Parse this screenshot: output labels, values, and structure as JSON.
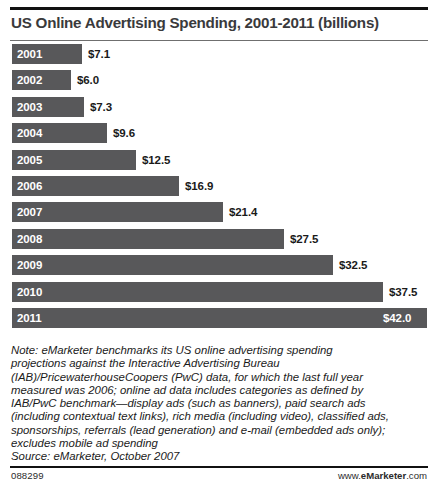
{
  "chart_data": {
    "type": "bar",
    "title": "US Online Advertising Spending, 2001-2011 (billions)",
    "orientation": "horizontal",
    "xlabel": "",
    "ylabel": "",
    "xlim": [
      0,
      42.0
    ],
    "grid": false,
    "legend": "none",
    "categories": [
      "2001",
      "2002",
      "2003",
      "2004",
      "2005",
      "2006",
      "2007",
      "2008",
      "2009",
      "2010",
      "2011"
    ],
    "values": [
      7.1,
      6.0,
      7.3,
      9.6,
      12.5,
      16.9,
      21.4,
      27.5,
      32.5,
      37.5,
      42.0
    ],
    "value_labels": [
      "$7.1",
      "$6.0",
      "$7.3",
      "$9.6",
      "$12.5",
      "$16.9",
      "$21.4",
      "$27.5",
      "$32.5",
      "$37.5",
      "$42.0"
    ],
    "label_placement": [
      "outside",
      "outside",
      "outside",
      "outside",
      "outside",
      "outside",
      "outside",
      "outside",
      "outside",
      "outside",
      "inside"
    ],
    "bar_color": "#58585a",
    "value_label_color": "#1a1a1a",
    "inside_label_color": "#ffffff",
    "category_label_color": "#ffffff"
  },
  "note": {
    "lines": [
      "Note: eMarketer benchmarks its US online advertising spending",
      "projections against the Interactive Advertising Bureau",
      "(IAB)/PricewaterhouseCoopers (PwC) data, for which the last full year",
      "measured was 2006; online ad data includes categories as defined by",
      "IAB/PwC benchmark—display ads (such as banners), paid search ads",
      "(including contextual text links), rich media (including video), classified ads,",
      "sponsorships, referrals (lead generation) and e-mail (embedded ads only);",
      "excludes mobile ad spending",
      "Source: eMarketer, October 2007"
    ]
  },
  "footer": {
    "id": "088299",
    "brand_prefix": "www.",
    "brand_name": "eMarketer",
    "brand_suffix": ".com"
  }
}
